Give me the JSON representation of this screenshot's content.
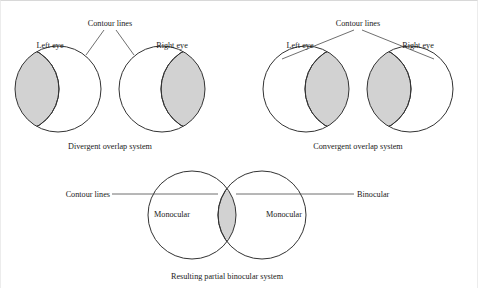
{
  "figure": {
    "background_color": "#ffffff",
    "shade_color": "#d2d2d2",
    "outline_color": "#333333",
    "leader_color": "#4a4a4a"
  },
  "panels": [
    {
      "id": "divergent",
      "caption": "Divergent overlap system",
      "contour_label": "Contour lines",
      "left_eye_label": "Left eye",
      "right_eye_label": "Right eye"
    },
    {
      "id": "convergent",
      "caption": "Convergent overlap system",
      "contour_label": "Contour lines",
      "left_eye_label": "Left eye",
      "right_eye_label": "Right eye"
    },
    {
      "id": "resulting",
      "caption": "Resulting partial binocular system",
      "contour_label": "Contour lines",
      "binocular_label": "Binocular",
      "monocular_left_label": "Monocular",
      "monocular_right_label": "Monocular"
    }
  ]
}
